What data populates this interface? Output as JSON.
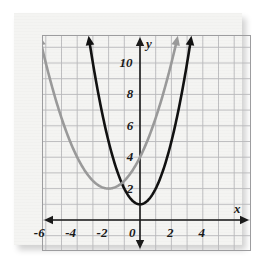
{
  "figure": {
    "kind": "coordinate-plane-graph",
    "paper_color": "#f4f4f2",
    "grid_color": "#b9b9bb",
    "axis_color": "#1a1a1a",
    "page_background": "#ffffff"
  },
  "chart_data": {
    "type": "line",
    "title": "",
    "subtitle": "",
    "xlabel": "x",
    "ylabel": "y",
    "xlim": [
      -6.9,
      6.0
    ],
    "ylim": [
      -1.9,
      11.9
    ],
    "grid": true,
    "grid_step": 1,
    "legend": "none",
    "x_ticks": [
      -6,
      -4,
      -2,
      0,
      2,
      4
    ],
    "x_tick_labels": [
      "-6",
      "-4",
      "-2",
      "0",
      "2",
      "4"
    ],
    "y_ticks": [
      2,
      4,
      6,
      8,
      10
    ],
    "y_tick_labels": [
      "2",
      "4",
      "6",
      "8",
      "10"
    ],
    "axis_label_x": "x",
    "axis_label_y": "y",
    "origin_label": "0",
    "series": [
      {
        "name": "black-parabola",
        "color": "#111111",
        "width": 2.6,
        "equation": "y = x^2 + 1",
        "vertex": [
          0,
          1
        ],
        "a": 1,
        "h": 0,
        "k": 1,
        "arrows": "both-ends-up",
        "points": [
          [
            -3.3,
            11.89
          ],
          [
            -3.0,
            10.0
          ],
          [
            -2.5,
            7.25
          ],
          [
            -2.0,
            5.0
          ],
          [
            -1.5,
            3.25
          ],
          [
            -1.0,
            2.0
          ],
          [
            -0.5,
            1.25
          ],
          [
            0.0,
            1.0
          ],
          [
            0.5,
            1.25
          ],
          [
            1.0,
            2.0
          ],
          [
            1.5,
            3.25
          ],
          [
            2.0,
            5.0
          ],
          [
            2.5,
            7.25
          ],
          [
            3.0,
            10.0
          ],
          [
            3.3,
            11.89
          ]
        ]
      },
      {
        "name": "gray-parabola",
        "color": "#9a9a9a",
        "width": 2.6,
        "equation": "y = 0.5(x + 2)^2 + 2",
        "vertex": [
          -2,
          2
        ],
        "a": 0.5,
        "h": -2,
        "k": 2,
        "arrows": "both-ends-up",
        "points": [
          [
            -6.45,
            11.9
          ],
          [
            -6.0,
            10.0
          ],
          [
            -5.0,
            6.5
          ],
          [
            -4.0,
            4.0
          ],
          [
            -3.0,
            2.5
          ],
          [
            -2.0,
            2.0
          ],
          [
            -1.0,
            2.5
          ],
          [
            0.0,
            4.0
          ],
          [
            1.0,
            6.5
          ],
          [
            2.0,
            10.0
          ],
          [
            2.45,
            11.9
          ]
        ]
      }
    ]
  }
}
